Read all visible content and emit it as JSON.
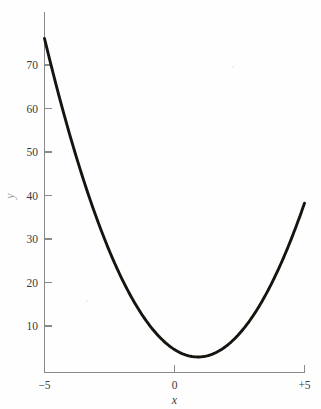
{
  "figure": {
    "background_color": "#fefefe",
    "curve_color": "#17140f",
    "axis_color": "#8a8a8a",
    "label_color": "#3b3b3b"
  },
  "axes": {
    "x_title": "x",
    "y_title": "y",
    "x_ticks": [
      {
        "value": -5,
        "label": "−5"
      },
      {
        "value": 0,
        "label": "0"
      },
      {
        "value": 5,
        "label": "+5"
      }
    ],
    "y_ticks": [
      {
        "value": 10,
        "label": "10"
      },
      {
        "value": 20,
        "label": "20"
      },
      {
        "value": 30,
        "label": "30"
      },
      {
        "value": 40,
        "label": "40"
      },
      {
        "value": 50,
        "label": "50"
      },
      {
        "value": 60,
        "label": "60"
      },
      {
        "value": 70,
        "label": "70"
      }
    ]
  },
  "chart_data": {
    "type": "line",
    "title": "",
    "subtitle": "",
    "xlabel": "x",
    "ylabel": "y",
    "xlim": [
      -5,
      5
    ],
    "ylim": [
      0,
      77
    ],
    "grid": false,
    "legend": false,
    "legend_position": "none",
    "xticks": [
      -5,
      0,
      5
    ],
    "xticklabels": [
      "−5",
      "0",
      "+5"
    ],
    "yticks": [
      10,
      20,
      30,
      40,
      50,
      60,
      70
    ],
    "yticklabels": [
      "10",
      "20",
      "30",
      "40",
      "50",
      "60",
      "70"
    ],
    "annotations": [],
    "series": [
      {
        "name": "parabola",
        "color": "#17140f",
        "equation": "y = 2.1x^2 - 3.8x + 4.8",
        "vertex": {
          "x": 0.9,
          "y": 3.0
        },
        "x": [
          -5.0,
          -4.5,
          -4.0,
          -3.5,
          -3.0,
          -2.5,
          -2.0,
          -1.5,
          -1.0,
          -0.5,
          0.0,
          0.5,
          1.0,
          1.5,
          2.0,
          2.5,
          3.0,
          3.5,
          4.0,
          4.5,
          5.0
        ],
        "values": [
          76.3,
          64.4,
          53.6,
          43.8,
          35.1,
          27.4,
          20.8,
          15.2,
          18.7,
          7.2,
          4.8,
          3.4,
          3.1,
          3.8,
          5.6,
          8.4,
          12.3,
          17.2,
          23.2,
          30.2,
          38.3
        ]
      }
    ]
  }
}
